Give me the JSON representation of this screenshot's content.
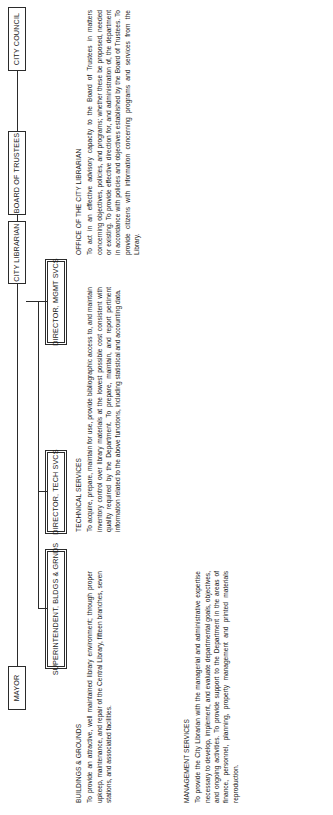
{
  "document": {
    "type": "organization-chart",
    "orientation": "landscape-rotated-90ccw",
    "title": "Library Department Organization Chart"
  },
  "boxes": {
    "mayor": "MAYOR",
    "city_council": "CITY COUNCIL",
    "board_of_trustees": "BOARD OF TRUSTEES",
    "city_librarian": "CITY LIBRARIAN",
    "director_mgmt_svcs": "DIRECTOR, MGMT SVCS",
    "director_tech_svcs": "DIRECTOR, TECH SVCS",
    "superintendent_bldgs": "SUPERINTENDENT, BLDGS & GRNDS"
  },
  "narratives": {
    "office_city_librarian": {
      "heading": "OFFICE OF THE CITY LIBRARIAN",
      "body": "To act in an effective advisory capacity to the Board of Trustees in matters concerning objectives, policies, and programs; whether these be proposed, needed or existing. To provide effective direction for, and administration of, the department in accordance with policies and objectives established by the Board of Trustees. To provide citizens with information concerning programs and services from the Library."
    },
    "technical_services": {
      "heading": "TECHNICAL SERVICES",
      "body": "To acquire, prepare, maintain for use, provide bibliographic access to, and maintain inventory control over library materials at the lowest possible cost consistent with quality required by the Department. To prepare, maintain, and report pertinent information related to the above functions, including statistical and accounting data."
    },
    "management_services": {
      "heading": "MANAGEMENT SERVICES",
      "body": "To provide the City Librarian with the managerial and administrative expertise necessary to develop, implement, and evaluate departmental goals, objectives, and ongoing activities. To provide support to the Department in the areas of finance, personnel, planning, property management and printed materials reproduction."
    },
    "buildings_grounds": {
      "heading": "BUILDINGS & GROUNDS",
      "body": "To provide an attractive, well maintained library environment; through proper upkeep, maintenance, and repair of the Central Library, fifteen branches, seven stations, and associated facilities."
    }
  },
  "colors": {
    "ink": "#1a1a1a",
    "line": "#2b2b2b",
    "paper": "#ffffff"
  }
}
